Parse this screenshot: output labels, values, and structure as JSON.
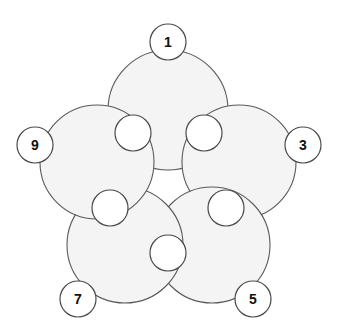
{
  "diagram": {
    "name": "five-petal-rosette",
    "type": "radial-overlapping-circles",
    "background_color": "#ffffff",
    "petal_fill_color": "#f4f4f4",
    "petal_stroke_color": "#5a5a5a",
    "junction_fill_color": "#ffffff",
    "junction_stroke_color": "#4a4a4a",
    "label_fill_color": "#ffffff",
    "label_stroke_color": "#4a4a4a",
    "label_text_color": "#111111",
    "center": {
      "x": 168,
      "y": 172
    },
    "petal_count": 5,
    "junction_count": 5,
    "petals": [
      {
        "id": "petal-top",
        "label": "1",
        "cx": 168,
        "cy": 110,
        "r": 60
      },
      {
        "id": "petal-right",
        "label": "3",
        "cx": 239,
        "cy": 162,
        "r": 57
      },
      {
        "id": "petal-bottom-right",
        "label": "5",
        "cx": 212,
        "cy": 245,
        "r": 58
      },
      {
        "id": "petal-bottom-left",
        "label": "7",
        "cx": 125,
        "cy": 245,
        "r": 58
      },
      {
        "id": "petal-left",
        "label": "9",
        "cx": 97,
        "cy": 162,
        "r": 57
      }
    ],
    "junctions": [
      {
        "id": "junction-top-right",
        "cx": 204,
        "cy": 133,
        "r": 18
      },
      {
        "id": "junction-right",
        "cx": 226,
        "cy": 208,
        "r": 18
      },
      {
        "id": "junction-bottom",
        "cx": 168,
        "cy": 253,
        "r": 18
      },
      {
        "id": "junction-left",
        "cx": 110,
        "cy": 208,
        "r": 18
      },
      {
        "id": "junction-top-left",
        "cx": 133,
        "cy": 133,
        "r": 18
      }
    ],
    "labels": [
      {
        "id": "label-1",
        "text": "1",
        "cx": 168,
        "cy": 42,
        "r": 18
      },
      {
        "id": "label-3",
        "text": "3",
        "cx": 303,
        "cy": 145,
        "r": 18
      },
      {
        "id": "label-5",
        "text": "5",
        "cx": 253,
        "cy": 299,
        "r": 18
      },
      {
        "id": "label-7",
        "text": "7",
        "cx": 78,
        "cy": 299,
        "r": 18
      },
      {
        "id": "label-9",
        "text": "9",
        "cx": 35,
        "cy": 145,
        "r": 18
      }
    ]
  }
}
